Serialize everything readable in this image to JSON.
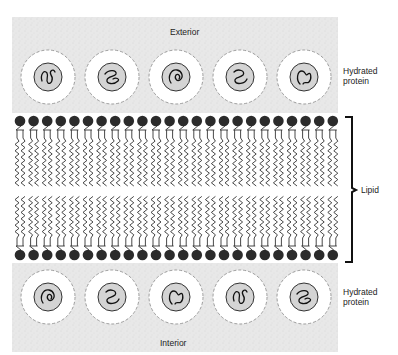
{
  "figure": {
    "labels": {
      "exterior": "Exterior",
      "interior": "Interior",
      "top_protein": "Hydrated protein",
      "bottom_protein": "Hydrated protein",
      "lipid": "Lipid"
    },
    "lipid_heads_per_layer": 24,
    "proteins_per_side": 5,
    "colors": {
      "background_region": "#e9e9e9",
      "hydration_shell": "#ffffff",
      "protein_core": "#d4d4d4",
      "lipid_head": "#2b2b2b",
      "lines": "#333333"
    }
  }
}
